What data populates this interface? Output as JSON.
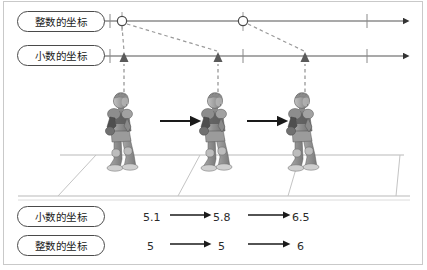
{
  "figure": {
    "title_present": false,
    "frame_color": "#c9c9c9",
    "background": "#ffffff",
    "axis_color": "#555555",
    "dashed_color": "#9a9a9a",
    "text_color": "#1a1a1a"
  },
  "labels": {
    "integer_coordinate": "整数的坐标",
    "decimal_coordinate": "小数的坐标"
  },
  "axes": {
    "integer_axis": {
      "name": "整数的坐标",
      "y": 21,
      "x_start": 106,
      "x_end": 412,
      "arrowhead": "right-triangle",
      "markers": [
        {
          "type": "circle",
          "x": 122
        },
        {
          "type": "circle",
          "x": 243
        }
      ],
      "ticks": [
        110,
        122,
        243,
        367
      ]
    },
    "decimal_axis": {
      "name": "小数的坐标",
      "y": 56,
      "x_start": 106,
      "x_end": 412,
      "arrowhead": "right-triangle",
      "markers": [
        {
          "type": "triangle",
          "x": 124
        },
        {
          "type": "triangle",
          "x": 218
        },
        {
          "type": "triangle",
          "x": 305
        }
      ],
      "ticks": [
        110,
        243,
        367
      ]
    },
    "connectors": [
      {
        "from_x": 122,
        "to_x": 124,
        "style": "dashed"
      },
      {
        "from_x": 122,
        "to_x": 218,
        "style": "dashed"
      },
      {
        "from_x": 243,
        "to_x": 305,
        "style": "dashed"
      }
    ],
    "risers": [
      {
        "x": 124,
        "style": "dashed",
        "from_y": 92,
        "to_y": 60
      },
      {
        "x": 218,
        "style": "dashed",
        "from_y": 92,
        "to_y": 60
      },
      {
        "x": 305,
        "style": "dashed",
        "from_y": 92,
        "to_y": 60
      }
    ]
  },
  "scene": {
    "description": "3D game character walking right across a perspective grid floor, shown in three successive positions",
    "characters": [
      {
        "index": 1,
        "x": 124,
        "decimal_coordinate": "5.1",
        "integer_coordinate": "5"
      },
      {
        "index": 2,
        "x": 218,
        "decimal_coordinate": "5.8",
        "integer_coordinate": "5"
      },
      {
        "index": 3,
        "x": 305,
        "decimal_coordinate": "6.5",
        "integer_coordinate": "6"
      }
    ],
    "motion_arrows": [
      {
        "from_x": 160,
        "to_x": 196
      },
      {
        "from_x": 246,
        "to_x": 282
      }
    ],
    "floor": {
      "type": "perspective-grid",
      "horizon_y": 155,
      "front_y": 195,
      "cell_boundaries_x": [
        96,
        200,
        300,
        400
      ]
    }
  },
  "readout": {
    "rows": [
      {
        "label": "小数的坐标",
        "values": [
          "5.1",
          "5.8",
          "6.5"
        ],
        "arrows": 2
      },
      {
        "label": "整数的坐标",
        "values": [
          "5",
          "5",
          "6"
        ],
        "arrows": 2
      }
    ]
  }
}
